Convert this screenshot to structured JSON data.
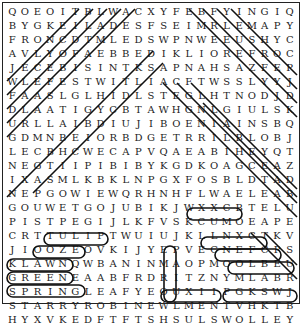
{
  "puzzle": {
    "type": "word-search",
    "rows": [
      "QOEOITBLWACXYFEBFYINGIQ",
      "BYGKEILADESFSEIMRLEMAPY",
      "FRONCDTMLEDSWPNWEEUSHYC",
      "AVLYOFAEBBEDIKLIOREFROC",
      "JECEBISINTKSAPNAHSAZFEP",
      "WLEFESTWITLIACFTWSSLYYJ",
      "FAASLGLHIDLSTEGLHTNODJD",
      "DLAATIGYCBTAWHGNLGIULSK",
      "URLLAIBDIUJIBOENIAINSBQ",
      "GDMNBEIORBDGETRRILBLOBJ",
      "LECBHCWECAPVQAEABIHEYQT",
      "NEGTIIPIBIBYKGDKOAGCEAZ",
      "IXASMLKBKLNPGXFOSBLDTAD",
      "NEPGOWIEWQRHNHFLWAELEAB",
      "GOUWETGOJUBIKJWXXCBTELU",
      "PISTPEGIJLKFVSKCUMOEAPE",
      "CRTTULIPTWUIUJKLLNXCTKV",
      "JIOOZEOVKIJYEPVECNEFCPS",
      "KLAWNQWBANINMAOPMOOLBEU",
      "GREENEAABFRDRITZNYMLABR",
      "SPRINGLEAFYEOUXIIPGKSWJ",
      "STARRYROBINEWLMENTVHKTB",
      "HYXVKEDFTFTSHSULSWOLLEY"
    ],
    "found_words_visible": [
      "TULIP",
      "OOZE",
      "LAWN",
      "GREEN",
      "SPRING",
      "LEAFY",
      "STARRY",
      "ROBIN",
      "KCUM",
      "FENCE",
      "BLOOM",
      "BALMY",
      "WORM",
      "SLUSH",
      "YELLOW"
    ]
  }
}
